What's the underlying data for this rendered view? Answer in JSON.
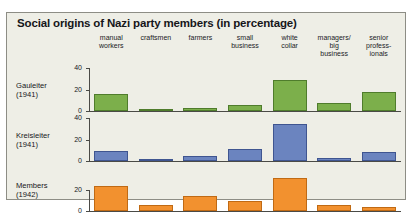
{
  "figure": {
    "title": "Social origins of Nazi party members (in percentage)",
    "background_color": "#eeeee6",
    "border_color": "#8d8d85"
  },
  "chart_data": {
    "type": "bar",
    "title": "Social origins of Nazi party members (in percentage)",
    "xlabel": "",
    "ylabel": "",
    "grid": false,
    "legend_position": "none",
    "categories": [
      "manual\nworkers",
      "craftsmen",
      "farmers",
      "small\nbusiness",
      "white\ncollar",
      "managers/\nbig\nbusiness",
      "senior\nprofess-\nionals"
    ],
    "panels": [
      {
        "name": "Gauleiter (1941)",
        "label": "Gauleiter\n(1941)",
        "color": "#7caf4b",
        "ylim": [
          0,
          40
        ],
        "yticks": [
          0,
          20,
          40
        ],
        "ytick_labels": [
          "0",
          "20",
          "40"
        ],
        "values": [
          16,
          1,
          3,
          6,
          29,
          7,
          18
        ]
      },
      {
        "name": "Kreisleiter (1941)",
        "label": "Kreisleiter\n(1941)",
        "color": "#6b84bf",
        "ylim": [
          0,
          40
        ],
        "yticks": [
          0,
          20,
          40
        ],
        "ytick_labels": [
          "0",
          "20",
          "40"
        ],
        "values": [
          9,
          2,
          5,
          11,
          34,
          3,
          8
        ]
      },
      {
        "name": "Members (1942)",
        "label": "Members\n(1942)",
        "color": "#f2912f",
        "ylim": [
          0,
          40
        ],
        "yticks": [
          0,
          20
        ],
        "ytick_labels": [
          "0",
          "20"
        ],
        "values": [
          23,
          6,
          14,
          9,
          31,
          6,
          4
        ]
      }
    ]
  }
}
